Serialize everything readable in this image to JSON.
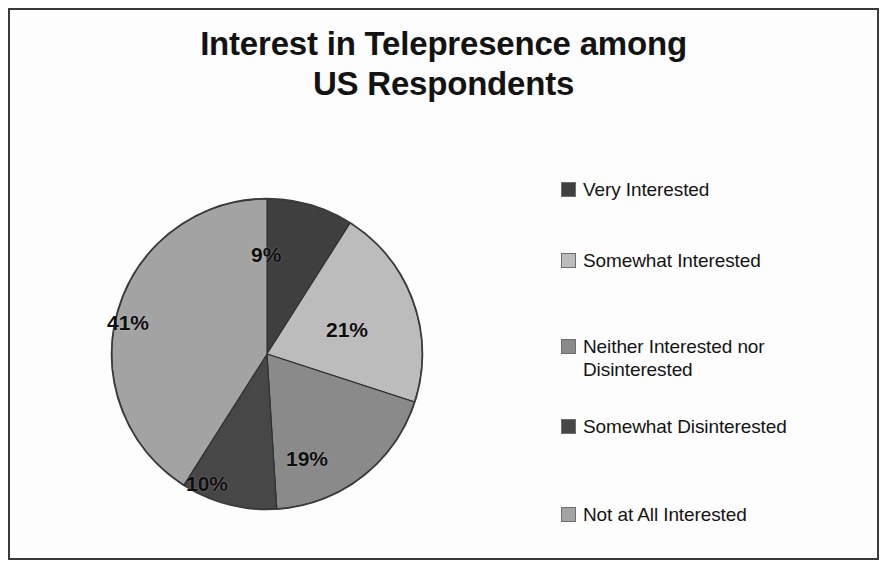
{
  "frame": {
    "border_color": "#3a3a3a",
    "background": "#fdfdfd"
  },
  "title": {
    "line1": "Interest in Telepresence among",
    "line2": "US Respondents",
    "full": "Interest in Telepresence among US Respondents"
  },
  "legend": {
    "position": "right",
    "items": [
      {
        "label": "Very Interested",
        "label_line2": "",
        "color": "#3f3f3f"
      },
      {
        "label": "Somewhat Interested",
        "label_line2": "",
        "color": "#bcbcbc"
      },
      {
        "label": "Neither Interested nor",
        "label_line2": "Disinterested",
        "color": "#8a8a8a"
      },
      {
        "label": "Somewhat Disinterested",
        "label_line2": "",
        "color": "#474747"
      },
      {
        "label": "Not at All Interested",
        "label_line2": "",
        "color": "#a3a3a3"
      }
    ]
  },
  "slice_labels": [
    {
      "text": "9%"
    },
    {
      "text": "21%"
    },
    {
      "text": "19%"
    },
    {
      "text": "10%"
    },
    {
      "text": "41%"
    }
  ],
  "chart_data": {
    "type": "pie",
    "title": "Interest in Telepresence among US Respondents",
    "xlabel": "",
    "ylabel": "",
    "units": "percent",
    "start_angle_deg": 0,
    "direction": "clockwise",
    "legend_position": "right",
    "grid": false,
    "categories": [
      "Very Interested",
      "Somewhat Interested",
      "Neither Interested nor Disinterested",
      "Somewhat Disinterested",
      "Not at All Interested"
    ],
    "values": [
      9,
      21,
      19,
      10,
      41
    ],
    "labels": [
      "9%",
      "21%",
      "19%",
      "10%",
      "41%"
    ],
    "colors": [
      "#3f3f3f",
      "#bcbcbc",
      "#8a8a8a",
      "#474747",
      "#a3a3a3"
    ],
    "slices": [
      {
        "name": "Very Interested",
        "value": 9,
        "label": "9%",
        "color": "#3f3f3f"
      },
      {
        "name": "Somewhat Interested",
        "value": 21,
        "label": "21%",
        "color": "#bcbcbc"
      },
      {
        "name": "Neither Interested nor Disinterested",
        "value": 19,
        "label": "19%",
        "color": "#8a8a8a"
      },
      {
        "name": "Somewhat Disinterested",
        "value": 10,
        "label": "10%",
        "color": "#474747"
      },
      {
        "name": "Not at All Interested",
        "value": 41,
        "label": "41%",
        "color": "#a3a3a3"
      }
    ],
    "total": 100
  }
}
